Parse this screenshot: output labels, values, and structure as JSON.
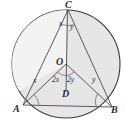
{
  "figure": {
    "kind": "circle-geometry-diagram",
    "background_color": "#ffffff",
    "fill_color": "#e3e3e3",
    "stroke_color": "#3a3a3a",
    "circle": {
      "cx": 66,
      "cy": 64,
      "r": 54
    },
    "points": {
      "C": {
        "label": "C",
        "x": 68,
        "y": 10
      },
      "O": {
        "label": "O",
        "x": 66,
        "y": 64
      },
      "D": {
        "label": "D",
        "x": 66,
        "y": 90
      },
      "A": {
        "label": "A",
        "x": 23,
        "y": 105
      },
      "B": {
        "label": "B",
        "x": 112,
        "y": 107
      }
    },
    "angles": {
      "at_c_left": "x",
      "at_c_right": "y",
      "at_a": "x",
      "at_b": "y",
      "at_o_left": "2x",
      "at_o_right": "2y"
    }
  },
  "labels": {
    "C": "C",
    "O": "O",
    "D": "D",
    "A": "A",
    "B": "B",
    "x_top": "x",
    "y_top": "y",
    "x_left": "x",
    "y_right": "y",
    "two_x": "2x",
    "two_y": "2y"
  }
}
